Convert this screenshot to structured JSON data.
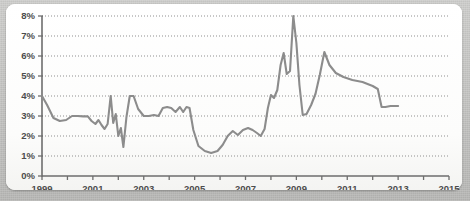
{
  "panel": {
    "background_color": "#fbfbfa",
    "frame_color": "#c4c4c2",
    "border_radius": "9px"
  },
  "chart_data": {
    "type": "line",
    "title": "",
    "subtitle": "",
    "xlabel": "",
    "ylabel": "",
    "grid": true,
    "legend": "none",
    "line_color": "#8c8c8c",
    "axis_color": "#6e6e6e",
    "grid_color": "#8f8f8f",
    "xlim": [
      1999,
      2015
    ],
    "ylim": [
      0,
      8
    ],
    "yticks": [
      0,
      1,
      2,
      3,
      4,
      5,
      6,
      7,
      8
    ],
    "ytick_labels": [
      "0%",
      "1%",
      "2%",
      "3%",
      "4%",
      "5%",
      "6%",
      "7%",
      "8%"
    ],
    "xticks": [
      1999,
      2000,
      2001,
      2002,
      2003,
      2004,
      2005,
      2006,
      2007,
      2008,
      2009,
      2010,
      2011,
      2012,
      2013,
      2014,
      2015
    ],
    "xtick_labels": [
      "1999",
      "",
      "2001",
      "",
      "2003",
      "",
      "2005",
      "",
      "2007",
      "",
      "2009",
      "",
      "2011",
      "",
      "2013",
      "",
      "2015"
    ],
    "unit": "%",
    "series": [
      {
        "name": "Rate",
        "x": [
          1999.0,
          1999.2,
          1999.45,
          1999.7,
          1999.95,
          2000.18,
          2000.4,
          2000.62,
          2000.8,
          2000.95,
          2001.1,
          2001.22,
          2001.34,
          2001.46,
          2001.58,
          2001.7,
          2001.8,
          2001.9,
          2002.0,
          2002.1,
          2002.2,
          2002.32,
          2002.45,
          2002.6,
          2002.78,
          2003.0,
          2003.2,
          2003.4,
          2003.58,
          2003.75,
          2003.92,
          2004.08,
          2004.25,
          2004.42,
          2004.55,
          2004.68,
          2004.8,
          2004.95,
          2005.15,
          2005.4,
          2005.65,
          2005.9,
          2006.1,
          2006.3,
          2006.5,
          2006.7,
          2006.9,
          2007.1,
          2007.28,
          2007.45,
          2007.6,
          2007.75,
          2007.88,
          2008.0,
          2008.12,
          2008.25,
          2008.38,
          2008.5,
          2008.62,
          2008.75,
          2008.88,
          2009.0,
          2009.12,
          2009.25,
          2009.4,
          2009.58,
          2009.75,
          2009.92,
          2010.1,
          2010.3,
          2010.55,
          2010.85,
          2011.2,
          2011.6,
          2012.0,
          2012.2,
          2012.35,
          2012.5,
          2012.7,
          2013.0
        ],
        "values": [
          4.0,
          3.55,
          2.9,
          2.75,
          2.8,
          3.0,
          3.0,
          2.98,
          2.98,
          2.75,
          2.6,
          2.8,
          2.55,
          2.35,
          2.6,
          4.0,
          2.65,
          3.1,
          2.0,
          2.4,
          1.45,
          2.95,
          4.0,
          4.0,
          3.35,
          3.0,
          3.0,
          3.05,
          3.0,
          3.4,
          3.45,
          3.4,
          3.2,
          3.45,
          3.2,
          3.45,
          3.4,
          2.3,
          1.5,
          1.25,
          1.15,
          1.25,
          1.55,
          2.0,
          2.25,
          2.05,
          2.3,
          2.4,
          2.3,
          2.15,
          2.0,
          2.35,
          3.4,
          4.05,
          3.9,
          4.3,
          5.55,
          6.15,
          5.1,
          5.25,
          8.0,
          6.65,
          4.55,
          3.05,
          3.1,
          3.55,
          4.1,
          5.05,
          6.2,
          5.55,
          5.15,
          4.95,
          4.8,
          4.7,
          4.5,
          4.35,
          3.45,
          3.45,
          3.5,
          3.5
        ]
      }
    ]
  }
}
